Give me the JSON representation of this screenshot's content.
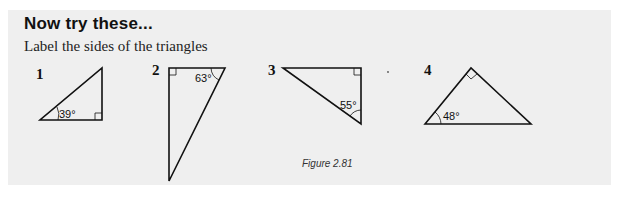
{
  "heading": "Now try these...",
  "instruction": "Label the sides of the triangles",
  "caption": "Figure 2.81",
  "colors": {
    "panel_background": "#efefef",
    "line": "#111111"
  },
  "triangles": [
    {
      "number": "1",
      "angle": "39°",
      "right_angle_at": "bottom-right"
    },
    {
      "number": "2",
      "angle": "63°",
      "right_angle_at": "top-left"
    },
    {
      "number": "3",
      "angle": "55°",
      "right_angle_at": "top-right"
    },
    {
      "number": "4",
      "angle": "48°",
      "right_angle_at": "apex"
    }
  ]
}
